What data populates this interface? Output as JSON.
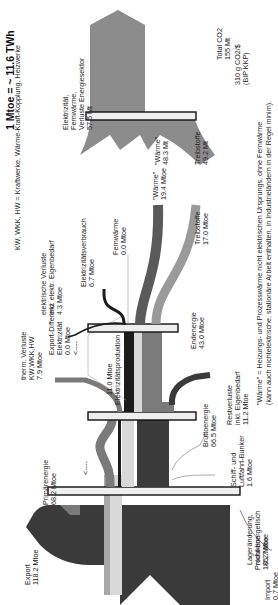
{
  "header": {
    "unit_note": "1 Mtoe = ~ 11.6 TWh",
    "abbrev_note": "KW, WKK, HW = Kraftwerke, Wärme-Kraft-Kopplung, Heizwerke"
  },
  "footnote": {
    "line1": "\"Wärme\" = Heizungs- und Prozesswärme nicht elektrischen Ursprungs, ohne Fernwärme",
    "line2": "(kann auch nichtelektrische, stationäre Arbeit enthalten, in Industrieländern in der Regel minim)."
  },
  "colors": {
    "dark": "#3a3a3a",
    "medium": "#7a7a7a",
    "light_gray": "#a8a8a8",
    "very_light": "#d8d8d8",
    "electric": "#1c1c1c",
    "co2": "#8c8c8c",
    "bar_fill": "#eeeeee"
  },
  "nodes": {
    "produktion": {
      "label": "Produktion",
      "value": "185.7 Mtoe"
    },
    "import": {
      "label": "Import",
      "value": "0.7 Mtoe"
    },
    "export": {
      "label": "Export",
      "value": "118.2 Mtoe"
    },
    "primaerenergie": {
      "label": "Primärenergie",
      "value": "68.2 Mtoe"
    },
    "lageraenderung": {
      "label1": "Lageränderung,",
      "label2": "nicht energetisch",
      "value": "0.2 Mtoe"
    },
    "bunker": {
      "label1": "Schiff- und",
      "label2": "Luftfahrt-Bunker",
      "value": "1.6 Mtoe"
    },
    "bruttoenergie": {
      "label": "Bruttoenergie",
      "value": "66.5 Mtoe"
    },
    "therm_verluste": {
      "label1": "therm. Verluste",
      "label2": "KW,WKK,HW",
      "value": "7.9 Mtoe"
    },
    "restverluste": {
      "label1": "Restverluste",
      "label2": "inkl. Eigenbedarf",
      "value": "11.2 Mtoe"
    },
    "export_diff": {
      "label1": "Export-Differenz",
      "label2": "Elektrizität",
      "value": "0.0 Mtoe",
      "arrow": "<----"
    },
    "elektrizitaetsproduktion": {
      "value": "11.0 Mtoe",
      "label": "Elektrizitätsproduktion"
    },
    "el_verluste": {
      "label1": "elektrische Verluste",
      "label2": "inkl. elektr. Eigenbedarf",
      "value": "4.3 Mtoe"
    },
    "endenergie": {
      "label": "Endenergie",
      "value": "43.0 Mtoe"
    },
    "elektrizitaetsverbrauch": {
      "label": "Elektrizitätsverbrauch",
      "value": "6.7 Mtoe"
    },
    "fernwaerme": {
      "label": "Fernwärme",
      "value": "0.0 Mtoe"
    },
    "waerme": {
      "label": "\"Wärme\"",
      "value": "19.4 Mtoe"
    },
    "treibstoffe": {
      "label": "Treibstoffe",
      "value": "17.0 Mtoe"
    },
    "primary_arrow": "<----",
    "co2_elektrizitaet": {
      "label1": "Elektrizität,",
      "label2": "Fernwärme,",
      "label3": "Verluste Energiesektor",
      "value": "57.5 Mt"
    },
    "co2_waerme": {
      "label": "\"Wärme\"",
      "value": "48.3 Mt"
    },
    "co2_treibstoffe": {
      "label": "Treibstoffe",
      "value": "49.2 Mt"
    },
    "co2_total": {
      "label": "Total CO2",
      "value": "155 Mt",
      "intensity1": "310 g CO2/$",
      "intensity2": "(BIP KKP)"
    }
  }
}
